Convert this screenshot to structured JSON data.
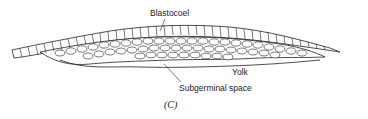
{
  "figure": {
    "caption": "(C)",
    "labels": {
      "blastocoel": "Blastocoel",
      "yolk": "Yolk",
      "subgerminal_space": "Subgerminal space"
    },
    "colors": {
      "line": "#222222",
      "cell_fill": "#ffffff",
      "background": "#ffffff"
    }
  }
}
